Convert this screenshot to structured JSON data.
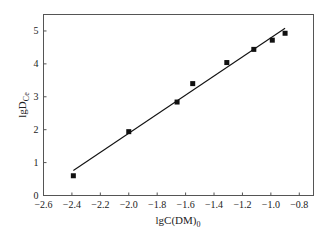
{
  "chart_data": {
    "type": "scatter",
    "title": "",
    "xlabel": "lgC(DM)",
    "xlabel_sub": "0",
    "ylabel": "lgD",
    "ylabel_sub": "Ce",
    "xlim": [
      -2.6,
      -0.7
    ],
    "ylim": [
      0,
      5.5
    ],
    "xticks": [
      -2.6,
      -2.4,
      -2.2,
      -2.0,
      -1.8,
      -1.6,
      -1.4,
      -1.2,
      -1.0,
      -0.8
    ],
    "xtick_labels": [
      "−2.6",
      "−2.4",
      "−2.2",
      "−2.0",
      "−1.8",
      "−1.6",
      "−1.4",
      "−1.2",
      "−1.0",
      "−0.8"
    ],
    "yticks": [
      0,
      1,
      2,
      3,
      4,
      5
    ],
    "ytick_labels": [
      "0",
      "1",
      "2",
      "3",
      "4",
      "5"
    ],
    "grid": false,
    "legend": null,
    "series": [
      {
        "name": "data",
        "marker": "square",
        "color": "#111111",
        "x": [
          -2.39,
          -2.0,
          -1.66,
          -1.55,
          -1.31,
          -1.12,
          -0.99,
          -0.9
        ],
        "y": [
          0.6,
          1.94,
          2.84,
          3.4,
          4.04,
          4.44,
          4.72,
          4.93
        ]
      },
      {
        "name": "linear fit",
        "type": "line",
        "color": "#111111",
        "x": [
          -2.39,
          -0.9
        ],
        "y": [
          0.76,
          5.08
        ]
      }
    ]
  }
}
